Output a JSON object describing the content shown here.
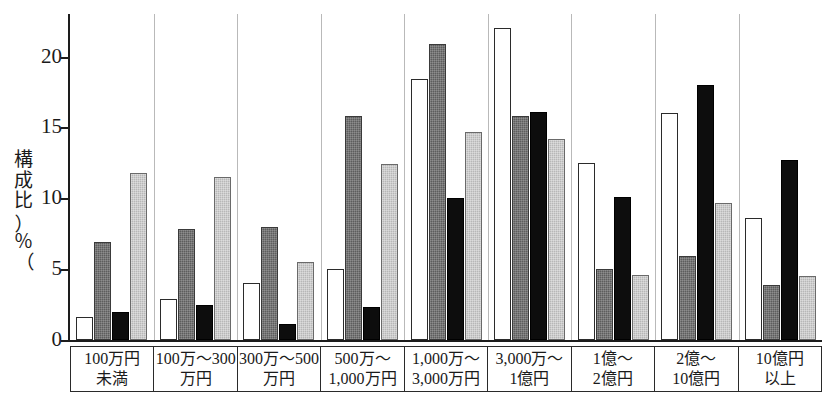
{
  "chart_data": {
    "type": "bar",
    "title": "",
    "xlabel": "",
    "ylabel": "構成比（％）",
    "ylim": [
      0,
      23
    ],
    "yticks": [
      0,
      5,
      10,
      15,
      20
    ],
    "ytick_labels": [
      "0",
      "5",
      "10",
      "15",
      "20"
    ],
    "grid": false,
    "legend_position": "none",
    "categories": [
      "100万円未満",
      "100万〜300万円",
      "300万〜500万円",
      "500万〜1,000万円",
      "1,000万〜3,000万円",
      "3,000万〜1億円",
      "1億〜2億円",
      "2億〜10億円",
      "10億円以上"
    ],
    "category_lines": [
      [
        "100万円",
        "未満"
      ],
      [
        "100万〜300",
        "万円"
      ],
      [
        "300万〜500",
        "万円"
      ],
      [
        "500万〜",
        "1,000万円"
      ],
      [
        "1,000万〜",
        "3,000万円"
      ],
      [
        "3,000万〜",
        "1億円"
      ],
      [
        "1億〜",
        "2億円"
      ],
      [
        "2億〜",
        "10億円"
      ],
      [
        "10億円",
        "以上"
      ]
    ],
    "series": [
      {
        "name": "series-1",
        "fill": "white",
        "color": "#ffffff",
        "values": [
          1.6,
          2.9,
          4.0,
          5.0,
          18.4,
          22.0,
          12.5,
          16.0,
          8.6
        ]
      },
      {
        "name": "series-2",
        "fill": "dark-gray",
        "color": "#5d5d5d",
        "values": [
          6.9,
          7.8,
          8.0,
          15.8,
          20.9,
          15.8,
          5.0,
          5.9,
          3.9
        ]
      },
      {
        "name": "series-3",
        "fill": "black",
        "color": "#0d0d0d",
        "values": [
          2.0,
          2.5,
          1.1,
          2.3,
          10.0,
          16.1,
          10.1,
          18.0,
          12.7
        ]
      },
      {
        "name": "series-4",
        "fill": "light-gray",
        "color": "#b7b7b7",
        "values": [
          11.8,
          11.5,
          5.5,
          12.4,
          14.7,
          14.2,
          4.6,
          9.7,
          4.5
        ]
      }
    ]
  },
  "axis": {
    "y_title_chars": [
      "構",
      "成",
      "比"
    ],
    "y_title_percent": "％"
  }
}
